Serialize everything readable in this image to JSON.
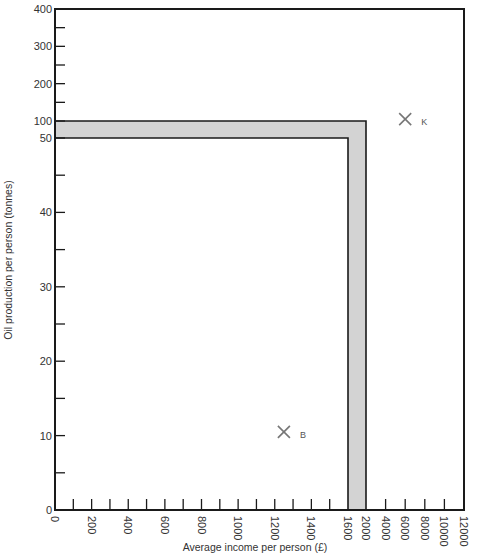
{
  "chart_data": {
    "type": "scatter",
    "title": "",
    "xlabel": "Average income per person (£)",
    "ylabel": "Oil production per person (tonnes)",
    "x_ticks": [
      "0",
      "200",
      "400",
      "600",
      "800",
      "1000",
      "1200",
      "1400",
      "1600",
      "2000",
      "4000",
      "6000",
      "8000",
      "10000",
      "12000"
    ],
    "y_ticks": [
      "0",
      "10",
      "20",
      "30",
      "40",
      "50",
      "100",
      "200",
      "300",
      "400"
    ],
    "scale_note": "Axes are broken: x linear 0-1600 then compressed 1600-12000; y linear 0-50 then compressed 50-400",
    "threshold_band": {
      "x_inner": 1600,
      "x_outer": 2000,
      "y_inner": 50,
      "y_outer": 100,
      "fill": "#d3d3d3"
    },
    "points": [
      {
        "label": "B",
        "x": 1250,
        "y": 10.5
      },
      {
        "label": "K",
        "x": 6000,
        "y": 105
      }
    ],
    "grid": false,
    "legend": null
  },
  "colors": {
    "axis": "#1a1a1a",
    "band": "#d3d3d3",
    "marker": "#777777",
    "text": "#333333"
  }
}
